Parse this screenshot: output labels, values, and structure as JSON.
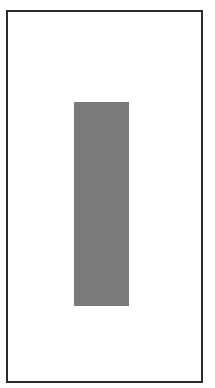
{
  "canvas": {
    "width": 215,
    "height": 388,
    "background": "#ffffff"
  },
  "frame": {
    "border_color": "#2b2b2b",
    "fill": "#ffffff"
  },
  "bar": {
    "fill": "#7a7a7a",
    "orientation": "vertical"
  }
}
